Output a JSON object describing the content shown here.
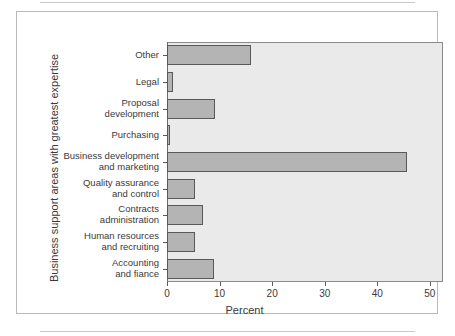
{
  "chart_data": {
    "type": "bar",
    "orientation": "horizontal",
    "title": "",
    "xlabel": "Percent",
    "ylabel": "Business support areas with greatest expertise",
    "xlim": [
      0,
      52.5
    ],
    "xticks": [
      0,
      10,
      20,
      30,
      40,
      50
    ],
    "xtick_labels": [
      "0",
      "10",
      "20",
      "30",
      "40",
      "50"
    ],
    "grid": false,
    "legend": null,
    "categories": [
      "Other",
      "Legal",
      "Proposal\ndevelopment",
      "Purchasing",
      "Business development\nand marketing",
      "Quality assurance\nand control",
      "Contracts\nadministration",
      "Human resources\nand recruiting",
      "Accounting\nand fiance"
    ],
    "values": [
      16,
      1.2,
      9.2,
      0.6,
      45.7,
      5.3,
      6.8,
      5.4,
      9
    ],
    "bar_color": "#b4b4b4",
    "bar_edge_color": "#595959",
    "plot_background": "#eaeaea"
  }
}
